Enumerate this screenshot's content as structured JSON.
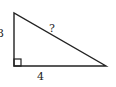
{
  "diagram": {
    "type": "right-triangle",
    "stroke_color": "#222222",
    "background": "#ffffff",
    "vertices": {
      "top": [
        14,
        13
      ],
      "right_angle": [
        14,
        66
      ],
      "right": [
        106,
        66
      ]
    },
    "labels": {
      "vertical_leg": "3",
      "horizontal_leg": "4",
      "hypotenuse": "?"
    },
    "right_angle_marker": true
  }
}
